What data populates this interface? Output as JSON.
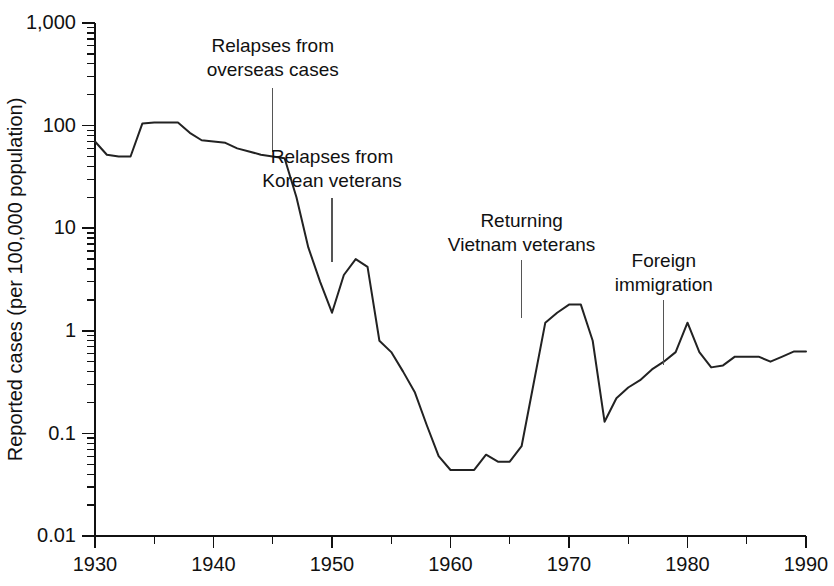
{
  "chart_data": {
    "type": "line",
    "title": "",
    "xlabel": "",
    "ylabel": "Reported cases (per 100,000 population)",
    "yscale": "log",
    "xlim": [
      1930,
      1990
    ],
    "ylim": [
      0.01,
      1000
    ],
    "grid": false,
    "legend": "none",
    "x_ticks": [
      1930,
      1940,
      1950,
      1960,
      1970,
      1980,
      1990
    ],
    "x_tick_labels": [
      "1930",
      "1940",
      "1950",
      "1960",
      "1970",
      "1980",
      "1990"
    ],
    "x_minor_ticks": [
      1935,
      1945,
      1955,
      1965,
      1975,
      1985
    ],
    "y_ticks": [
      0.01,
      0.1,
      1,
      10,
      100,
      1000
    ],
    "y_tick_labels": [
      "0.01",
      "0.1",
      "1",
      "10",
      "100",
      "1,000"
    ],
    "series": [
      {
        "name": "Reported cases",
        "color": "#222222",
        "x": [
          1930,
          1931,
          1932,
          1933,
          1934,
          1935,
          1936,
          1937,
          1938,
          1939,
          1940,
          1941,
          1942,
          1943,
          1944,
          1945,
          1946,
          1947,
          1948,
          1949,
          1950,
          1951,
          1952,
          1953,
          1954,
          1955,
          1956,
          1957,
          1958,
          1959,
          1960,
          1961,
          1962,
          1963,
          1964,
          1965,
          1966,
          1967,
          1968,
          1969,
          1970,
          1971,
          1972,
          1973,
          1974,
          1975,
          1976,
          1977,
          1978,
          1979,
          1980,
          1981,
          1982,
          1983,
          1984,
          1985,
          1986,
          1987,
          1988,
          1989,
          1990
        ],
        "values": [
          70,
          52,
          50,
          50,
          105,
          107,
          107,
          107,
          85,
          72,
          70,
          68,
          60,
          56,
          52,
          50,
          48,
          20,
          6.5,
          3.0,
          1.5,
          3.5,
          5.0,
          4.2,
          0.8,
          0.62,
          0.4,
          0.25,
          0.12,
          0.06,
          0.044,
          0.044,
          0.044,
          0.062,
          0.053,
          0.053,
          0.075,
          0.3,
          1.2,
          1.5,
          1.8,
          1.8,
          0.8,
          0.13,
          0.22,
          0.28,
          0.33,
          0.42,
          0.5,
          0.62,
          1.2,
          0.62,
          0.44,
          0.46,
          0.56,
          0.56,
          0.56,
          0.5,
          0.56,
          0.63,
          0.63
        ]
      }
    ],
    "annotations": [
      {
        "id": "relapses-overseas",
        "lines": [
          "Relapses from",
          "overseas cases"
        ],
        "text_x": 1945,
        "text_y_px": 52,
        "leader_x": 1945,
        "leader_y_top_px": 88,
        "leader_y_bottom_px": 152
      },
      {
        "id": "relapses-korean",
        "lines": [
          "Relapses from",
          "Korean veterans"
        ],
        "text_x": 1950,
        "text_y_px": 163,
        "leader_x": 1950,
        "leader_y_top_px": 198,
        "leader_y_bottom_px": 262
      },
      {
        "id": "returning-vietnam",
        "lines": [
          "Returning",
          "Vietnam veterans"
        ],
        "text_x": 1966,
        "text_y_px": 227,
        "leader_x": 1966,
        "leader_y_top_px": 260,
        "leader_y_bottom_px": 318
      },
      {
        "id": "foreign-immigration",
        "lines": [
          "Foreign",
          "immigration"
        ],
        "text_x": 1978,
        "text_y_px": 267,
        "leader_x": 1978,
        "leader_y_top_px": 300,
        "leader_y_bottom_px": 365
      }
    ]
  }
}
